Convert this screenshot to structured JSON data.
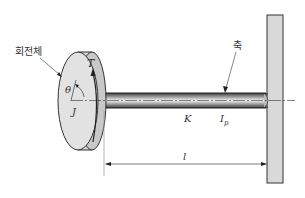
{
  "diagram": {
    "labels": {
      "rotor": "회전체",
      "shaft": "축",
      "torque": "T",
      "angle": "θ",
      "inertia": "J",
      "stiffness": "K",
      "polar_moment": "I",
      "polar_moment_sub": "p",
      "length": "l"
    },
    "colors": {
      "outline": "#333333",
      "disk_face": "#e2e2e2",
      "disk_rim": "#cfcfcf",
      "shaft_dark": "#555555",
      "shaft_light": "#f0f0f0",
      "wall": "#d9d9d9"
    }
  }
}
